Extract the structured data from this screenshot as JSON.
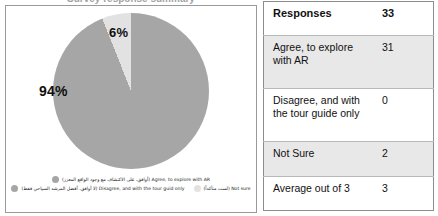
{
  "cut_title": "Survey response summary",
  "chart_data": {
    "type": "pie",
    "title": "",
    "categories": [
      "Agree, to explore with AR (أوافق، على الاكتشاف مع وجود الواقع المعزز)",
      "Disagree, and with the tour guid only (لا أوافق، أفضل المرشد السياحي فقط)",
      "Not sure (لست متأكداً)"
    ],
    "values": [
      94,
      6,
      0
    ],
    "data_labels": [
      "94%",
      "6%"
    ],
    "counts": [
      31,
      0,
      2
    ],
    "colors": [
      "#a6a6a6",
      "#a6a6a6",
      "#e2e2e2"
    ],
    "legend_position": "bottom",
    "grid": false
  },
  "chart": {
    "slices": [
      {
        "label": "94%",
        "color": "#a6a6a6"
      },
      {
        "label": "6%",
        "color": "#e2e2e2"
      }
    ],
    "legend": {
      "row1": [
        {
          "text": "Agree, to explore with AR (أوافق، على الاكتشاف مع وجود الواقع المعزز)",
          "color": "#a6a6a6"
        }
      ],
      "row2": [
        {
          "text": "Disagree, and with the tour guid only (لا أوافق، أفضل المرشد السياحي فقط)",
          "color": "#a6a6a6"
        },
        {
          "text": "Not sure (لست متأكداً)",
          "color": "#e2e2e2"
        }
      ]
    }
  },
  "table": {
    "rows": [
      {
        "label": "Responses",
        "value": "33",
        "header": true,
        "band": false
      },
      {
        "label": "Agree, to explore with AR",
        "value": "31",
        "header": false,
        "band": true
      },
      {
        "label": "Disagree, and with the tour guide only",
        "value": "0",
        "header": false,
        "band": false
      },
      {
        "label": "Not Sure",
        "value": "2",
        "header": false,
        "band": true
      },
      {
        "label": "Average out of 3",
        "value": "3",
        "header": false,
        "band": false
      }
    ]
  }
}
